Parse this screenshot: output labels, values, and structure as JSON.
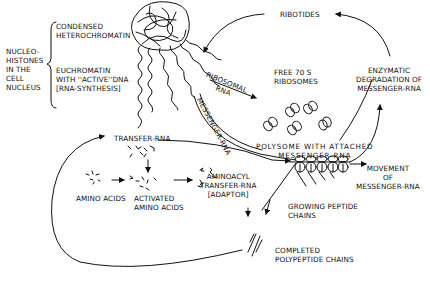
{
  "diagram": {
    "labels": {
      "nucleohistones": [
        "NUCLEO-",
        "HISTONES",
        "IN THE",
        "CELL",
        "NUCLEUS"
      ],
      "condensed": [
        "CONDENSED",
        "HETEROCHROMATIN"
      ],
      "euchromatin": [
        "EUCHROMATIN",
        "WITH ''ACTIVE''DNA",
        "[RNA-SYNTHESIS]"
      ],
      "ribotides": "RIBOTIDES",
      "ribosomal_rna": [
        "RIBOSOMAL",
        "RNA"
      ],
      "messenger_rna_strand": "MESSENGER-RNA",
      "free_ribosomes": [
        "FREE  70 S",
        "RIBOSOMES"
      ],
      "enzymatic_degradation": [
        "ENZYMATIC",
        "DEGRADATION OF",
        "MESSENGER-RNA"
      ],
      "transfer_rna": "TRANSFER-RNA",
      "polysome": [
        "POLYSOME WITH ATTACHED",
        "MESSENGER-RNA"
      ],
      "movement": [
        "MOVEMENT",
        "OF",
        "MESSENGER-RNA"
      ],
      "amino_acids": "AMINO  ACIDS",
      "activated_amino_acids": [
        "ACTIVATED",
        "AMINO ACIDS"
      ],
      "aminoacyl": [
        "AMINOACYL",
        "TRANSFER-RNA",
        "[ADAPTOR]"
      ],
      "growing_chains": [
        "GROWING  PEPTIDE",
        "CHAINS"
      ],
      "completed_chains": [
        "COMPLETED",
        "POLYPEPTIDE  CHAINS"
      ]
    },
    "colors": {
      "ink": "#111111",
      "background": "#ffffff"
    }
  }
}
